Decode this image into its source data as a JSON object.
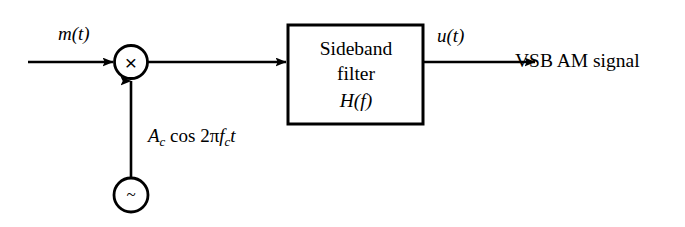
{
  "diagram": {
    "background_color": "#ffffff",
    "stroke_color": "#000000",
    "input": {
      "label": "m(t)",
      "label_math": {
        "base": "m",
        "arg": "(t)"
      }
    },
    "multiplier": {
      "name": "multiplier",
      "glyph": "×",
      "shape": "circle",
      "center_x": 131,
      "center_y": 62,
      "radius": 16
    },
    "oscillator": {
      "name": "local-oscillator",
      "glyph": "~",
      "shape": "circle",
      "center_x": 131,
      "center_y": 195,
      "radius": 17,
      "output_label": {
        "full_text": "Ac cos 2πfc t",
        "amplitude": "A",
        "amplitude_sub": "c",
        "function": "cos",
        "two_pi": "2π",
        "frequency": "f",
        "frequency_sub": "c",
        "time": "t"
      }
    },
    "filter_block": {
      "name": "sideband-filter",
      "line_1": "Sideband",
      "line_2": "filter",
      "line_3_base": "H",
      "line_3_arg": "(f)",
      "line_3_full": "H(f)",
      "x": 288,
      "y": 25,
      "width": 135,
      "height": 99
    },
    "output": {
      "signal_label": "u(t)",
      "signal_base": "u",
      "signal_arg": "(t)",
      "destination_text": "VSB AM signal"
    },
    "connections": [
      {
        "name": "input-to-multiplier",
        "from": "m(t)",
        "to": "multiplier"
      },
      {
        "name": "oscillator-to-multiplier",
        "from": "oscillator",
        "to": "multiplier"
      },
      {
        "name": "multiplier-to-filter",
        "from": "multiplier",
        "to": "sideband filter"
      },
      {
        "name": "filter-to-output",
        "from": "sideband filter",
        "to": "VSB AM signal"
      }
    ]
  }
}
